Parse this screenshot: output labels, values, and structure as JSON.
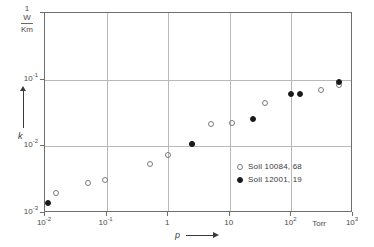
{
  "chart_data": {
    "type": "scatter",
    "title": "",
    "xlabel": "p",
    "ylabel": "k",
    "x_unit": "Torr",
    "y_unit_numerator": "W",
    "y_unit_denominator": "Km",
    "y_unit_top": "1",
    "xscale": "log",
    "yscale": "log",
    "xlim": [
      0.01,
      1000
    ],
    "ylim": [
      0.001,
      1
    ],
    "grid": true,
    "legend_position": "inside-lower-right",
    "x_ticks": [
      {
        "value": 0.01,
        "label": "10",
        "exp": "-2"
      },
      {
        "value": 0.1,
        "label": "10",
        "exp": "-1"
      },
      {
        "value": 1,
        "label": "1",
        "exp": ""
      },
      {
        "value": 10,
        "label": "10",
        "exp": ""
      },
      {
        "value": 100,
        "label": "10",
        "exp": "2"
      },
      {
        "value": 1000,
        "label": "10",
        "exp": "3"
      }
    ],
    "y_ticks": [
      {
        "value": 1,
        "label": "1",
        "exp": ""
      },
      {
        "value": 0.1,
        "label": "10",
        "exp": "-1"
      },
      {
        "value": 0.01,
        "label": "10",
        "exp": "-2"
      },
      {
        "value": 0.001,
        "label": "10",
        "exp": "-3"
      }
    ],
    "series": [
      {
        "name": "Soil 10084, 68",
        "marker": "open-circle",
        "color": "#7a7a7a",
        "points": [
          {
            "x": 0.015,
            "y": 0.002
          },
          {
            "x": 0.05,
            "y": 0.0028
          },
          {
            "x": 0.095,
            "y": 0.0031
          },
          {
            "x": 0.5,
            "y": 0.0055
          },
          {
            "x": 1.0,
            "y": 0.0073
          },
          {
            "x": 2.4,
            "y": 0.011
          },
          {
            "x": 5.0,
            "y": 0.022
          },
          {
            "x": 11.0,
            "y": 0.0222
          },
          {
            "x": 37.0,
            "y": 0.044
          },
          {
            "x": 300.0,
            "y": 0.07
          },
          {
            "x": 600.0,
            "y": 0.082
          }
        ]
      },
      {
        "name": "Soil 12001, 19",
        "marker": "filled-circle",
        "color": "#1a1a1a",
        "points": [
          {
            "x": 0.011,
            "y": 0.0014
          },
          {
            "x": 2.4,
            "y": 0.011
          },
          {
            "x": 24.0,
            "y": 0.026
          },
          {
            "x": 100.0,
            "y": 0.061
          },
          {
            "x": 140.0,
            "y": 0.062
          },
          {
            "x": 600.0,
            "y": 0.092
          }
        ]
      }
    ]
  },
  "legend": {
    "entries": [
      {
        "label": "Soil 10084, 68"
      },
      {
        "label": "Soil 12001, 19"
      }
    ]
  },
  "axes": {
    "x_title": "p",
    "y_title": "k",
    "x_unit_label": "Torr"
  }
}
